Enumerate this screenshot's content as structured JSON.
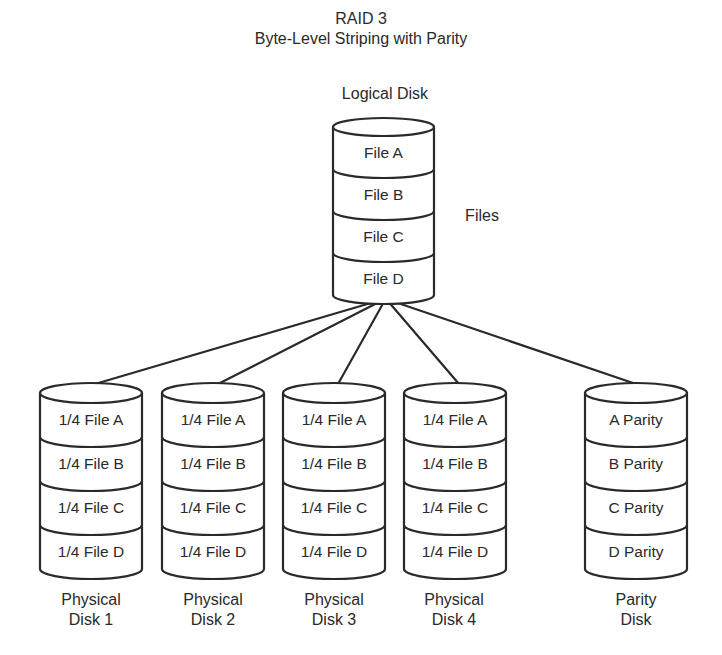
{
  "title": "RAID 3",
  "subtitle": "Byte-Level Striping with Parity",
  "logical_disk": {
    "label": "Logical Disk",
    "segments": [
      "File A",
      "File B",
      "File C",
      "File D"
    ],
    "side_label": "Files"
  },
  "physical_disks": [
    {
      "label_line1": "Physical",
      "label_line2": "Disk 1",
      "segments": [
        "1/4 File A",
        "1/4 File B",
        "1/4 File C",
        "1/4 File D"
      ]
    },
    {
      "label_line1": "Physical",
      "label_line2": "Disk 2",
      "segments": [
        "1/4 File A",
        "1/4 File B",
        "1/4 File C",
        "1/4 File D"
      ]
    },
    {
      "label_line1": "Physical",
      "label_line2": "Disk 3",
      "segments": [
        "1/4 File A",
        "1/4 File B",
        "1/4 File C",
        "1/4 File D"
      ]
    },
    {
      "label_line1": "Physical",
      "label_line2": "Disk 4",
      "segments": [
        "1/4 File A",
        "1/4 File B",
        "1/4 File C",
        "1/4 File D"
      ]
    }
  ],
  "parity_disk": {
    "label_line1": "Parity",
    "label_line2": "Disk",
    "segments": [
      "A Parity",
      "B Parity",
      "C  Parity",
      "D Parity"
    ]
  },
  "colors": {
    "stroke": "#2a2a2a",
    "background": "#ffffff"
  }
}
